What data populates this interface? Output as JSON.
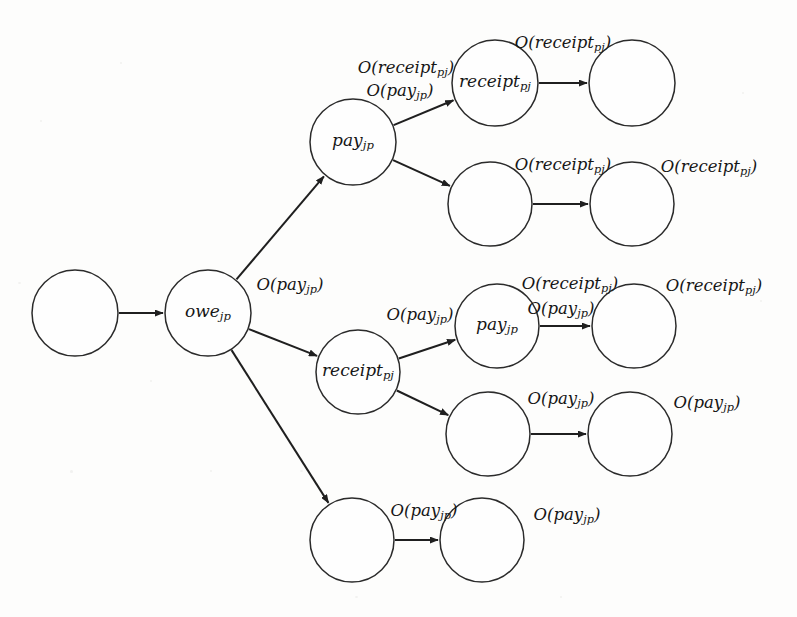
{
  "figure": {
    "background_color": "#fdfdfc",
    "stroke_color": "#2b2b2b",
    "text_color": "#161616",
    "width": 797,
    "height": 617
  },
  "nodes": [
    {
      "id": "root",
      "label": "",
      "sub": "",
      "cx": 75,
      "cy": 313,
      "r": 43
    },
    {
      "id": "owe",
      "label": "owe",
      "sub": "jp",
      "cx": 208,
      "cy": 313,
      "r": 43
    },
    {
      "id": "pay_top",
      "label": "pay",
      "sub": "jp",
      "cx": 353,
      "cy": 142,
      "r": 43
    },
    {
      "id": "rcpt_r1",
      "label": "receipt",
      "sub": "pj",
      "cx": 495,
      "cy": 83,
      "r": 43
    },
    {
      "id": "end_r1",
      "label": "",
      "sub": "",
      "cx": 632,
      "cy": 83,
      "r": 43
    },
    {
      "id": "mid_r2",
      "label": "",
      "sub": "",
      "cx": 490,
      "cy": 204,
      "r": 42
    },
    {
      "id": "end_r2",
      "label": "",
      "sub": "",
      "cx": 632,
      "cy": 204,
      "r": 42
    },
    {
      "id": "rcpt_mid",
      "label": "receipt",
      "sub": "pj",
      "cx": 358,
      "cy": 372,
      "r": 42
    },
    {
      "id": "pay_mid",
      "label": "pay",
      "sub": "jp",
      "cx": 497,
      "cy": 326,
      "r": 42
    },
    {
      "id": "end_r3",
      "label": "",
      "sub": "",
      "cx": 634,
      "cy": 326,
      "r": 42
    },
    {
      "id": "mid_r4",
      "label": "",
      "sub": "",
      "cx": 488,
      "cy": 434,
      "r": 42
    },
    {
      "id": "end_r4",
      "label": "",
      "sub": "",
      "cx": 630,
      "cy": 434,
      "r": 42
    },
    {
      "id": "bot_left",
      "label": "",
      "sub": "",
      "cx": 352,
      "cy": 540,
      "r": 42
    },
    {
      "id": "bot_right",
      "label": "",
      "sub": "",
      "cx": 482,
      "cy": 540,
      "r": 42
    }
  ],
  "edges": [
    {
      "id": "e-root-owe",
      "from": "root",
      "to": "owe",
      "kind": "straight"
    },
    {
      "id": "e-owe-paytop",
      "from": "owe",
      "to": "pay_top",
      "kind": "diagonal-up"
    },
    {
      "id": "e-owe-rcptmid",
      "from": "owe",
      "to": "rcpt_mid",
      "kind": "diagonal-down"
    },
    {
      "id": "e-owe-botleft",
      "from": "owe",
      "to": "bot_left",
      "kind": "diagonal-down"
    },
    {
      "id": "e-paytop-rcptr1",
      "from": "pay_top",
      "to": "rcpt_r1",
      "kind": "diagonal-up"
    },
    {
      "id": "e-paytop-midr2",
      "from": "pay_top",
      "to": "mid_r2",
      "kind": "diagonal-down"
    },
    {
      "id": "e-rcptr1-endr1",
      "from": "rcpt_r1",
      "to": "end_r1",
      "kind": "straight"
    },
    {
      "id": "e-midr2-endr2",
      "from": "mid_r2",
      "to": "end_r2",
      "kind": "straight"
    },
    {
      "id": "e-rcptmid-paymid",
      "from": "rcpt_mid",
      "to": "pay_mid",
      "kind": "diagonal-up"
    },
    {
      "id": "e-rcptmid-midr4",
      "from": "rcpt_mid",
      "to": "mid_r4",
      "kind": "diagonal-down"
    },
    {
      "id": "e-paymid-endr3",
      "from": "pay_mid",
      "to": "end_r3",
      "kind": "straight"
    },
    {
      "id": "e-midr4-endr4",
      "from": "mid_r4",
      "to": "end_r4",
      "kind": "straight"
    },
    {
      "id": "e-botleft-botright",
      "from": "bot_left",
      "to": "bot_right",
      "kind": "straight"
    }
  ],
  "labels": [
    {
      "id": "lbl-owe-pay",
      "text": "O(pay",
      "sub": "jp",
      "x": 290,
      "y": 286
    },
    {
      "id": "lbl-paytop-receipt",
      "text": "O(receipt",
      "sub": "pj",
      "x": 406,
      "y": 69
    },
    {
      "id": "lbl-paytop-pay",
      "text": "O(pay",
      "sub": "jp",
      "x": 400,
      "y": 92
    },
    {
      "id": "lbl-r1-receipt",
      "text": "O(receipt",
      "sub": "pj",
      "x": 563,
      "y": 44
    },
    {
      "id": "lbl-r2-receipt",
      "text": "O(receipt",
      "sub": "pj",
      "x": 563,
      "y": 166
    },
    {
      "id": "lbl-r2-end",
      "text": "O(receipt",
      "sub": "pj",
      "x": 709,
      "y": 168
    },
    {
      "id": "lbl-rcptmid-pay",
      "text": "O(pay",
      "sub": "jp",
      "x": 420,
      "y": 316
    },
    {
      "id": "lbl-r3-receipt",
      "text": "O(receipt",
      "sub": "pj",
      "x": 570,
      "y": 285
    },
    {
      "id": "lbl-r3-pay",
      "text": "O(pay",
      "sub": "jp",
      "x": 561,
      "y": 310
    },
    {
      "id": "lbl-r3-end",
      "text": "O(receipt",
      "sub": "pj",
      "x": 714,
      "y": 287
    },
    {
      "id": "lbl-r4-pay",
      "text": "O(pay",
      "sub": "jp",
      "x": 561,
      "y": 400
    },
    {
      "id": "lbl-r4-end",
      "text": "O(pay",
      "sub": "jp",
      "x": 707,
      "y": 404
    },
    {
      "id": "lbl-bot-pay",
      "text": "O(pay",
      "sub": "jp",
      "x": 424,
      "y": 512
    },
    {
      "id": "lbl-bot-end",
      "text": "O(pay",
      "sub": "jp",
      "x": 567,
      "y": 516
    }
  ]
}
